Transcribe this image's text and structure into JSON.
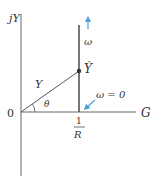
{
  "diagram": {
    "axes": {
      "vertical_label": "jY",
      "horizontal_label": "G",
      "origin_label": "0"
    },
    "locus": {
      "phasor_label": "Y",
      "point_label": "Ẏ",
      "angle_label": "θ",
      "frequency_label": "ω",
      "zero_frequency_label": "ω = 0",
      "intercept_numerator": "1",
      "intercept_denominator": "R"
    },
    "colors": {
      "axis": "#666666",
      "locus_line": "#555555",
      "arrow": "#4a9fd8",
      "text": "#333333"
    }
  }
}
